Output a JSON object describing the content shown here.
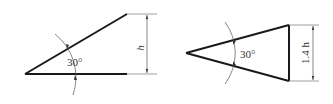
{
  "figures": [
    {
      "name": "right-triangle-wedge",
      "angle_label": "30°",
      "dimension_label": "h"
    },
    {
      "name": "isosceles-triangle",
      "angle_label": "30°",
      "dimension_label": "1.4 h"
    }
  ],
  "colors": {
    "stroke": "#1a1a1a",
    "thin": "#555555",
    "background": "#ffffff"
  }
}
